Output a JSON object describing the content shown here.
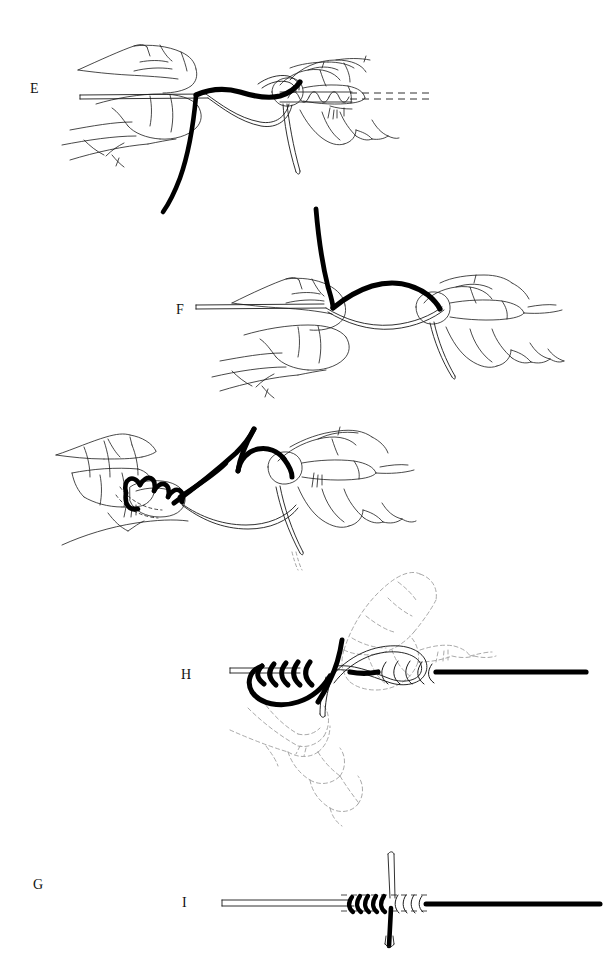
{
  "document": {
    "kind": "instructional-line-drawing",
    "subject": "fishing line knot tying sequence",
    "background_color": "#ffffff",
    "ink_color": "#000000",
    "thin_line_color": "#1a1a1a",
    "ghost_line_color": "#9a9a9a",
    "total_panels": 5
  },
  "panels": [
    {
      "id": "E",
      "label": "E",
      "label_x": 30,
      "label_y": 90,
      "caption": "Hands holding leader and fly line with coiled wraps; dashed line continues to the right",
      "elements": [
        "left-hand-holding-line",
        "right-hand-holding-coils",
        "thin-double-line",
        "thick-black-line-arc",
        "coil-wraps",
        "dashed-line-extension",
        "hanging-tag-loop"
      ]
    },
    {
      "id": "F",
      "label": "F",
      "label_x": 176,
      "label_y": 311,
      "caption": "Two hands pinching line; thick black strand rises vertically from the left pinch and arcs over to the right hand",
      "elements": [
        "left-hand-pinching",
        "right-hand-pinching",
        "thin-double-line",
        "thick-black-vertical-tag",
        "thick-black-arc",
        "thin-loop-below",
        "hanging-tag-end"
      ]
    },
    {
      "id": "G",
      "label": "G",
      "label_x": 33,
      "label_y": 491,
      "caption": "Left hand wrapping the black strand in coils around the finger and line while right hand holds the loop",
      "elements": [
        "left-hand-wrapping",
        "right-hand-holding",
        "black-coil-wraps",
        "thick-black-crossing-strand",
        "thin-loop",
        "hanging-tag-end"
      ]
    },
    {
      "id": "H",
      "label": "H",
      "label_x": 181,
      "label_y": 676,
      "caption": "Knot being drawn tight: black wraps on the left, thin-line wraps on the right, ghosted dashed hands above and below",
      "elements": [
        "thin-double-line-left",
        "black-wraps-left",
        "thin-wraps-right",
        "thick-black-line-right",
        "thin-loop",
        "black-tag-end",
        "ghost-hand-upper",
        "ghost-hand-lower"
      ]
    },
    {
      "id": "I",
      "label": "I",
      "label_x": 182,
      "label_y": 904,
      "caption": "Finished knot seated: thin line left, thick black line right, vertical tag ends trimmed, dashed alignment guides",
      "elements": [
        "thin-double-line-left",
        "black-coils",
        "white-coils",
        "thick-black-line-right",
        "vertical-white-tag-up",
        "vertical-black-tag-down",
        "dashed-guide-lines"
      ]
    }
  ]
}
